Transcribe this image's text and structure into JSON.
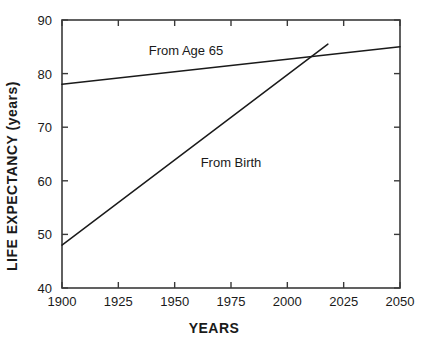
{
  "chart_data": {
    "type": "line",
    "title": "",
    "xlabel": "YEARS",
    "ylabel": "LIFE EXPECTANCY (years)",
    "xlim": [
      1900,
      2050
    ],
    "ylim": [
      40,
      90
    ],
    "xticks": [
      1900,
      1925,
      1950,
      1975,
      2000,
      2025,
      2050
    ],
    "yticks": [
      40,
      50,
      60,
      70,
      80,
      90
    ],
    "xtick_labels": [
      "1900",
      "1925",
      "1950",
      "1975",
      "2000",
      "2025",
      "2050"
    ],
    "ytick_labels": [
      "40",
      "50",
      "60",
      "70",
      "80",
      "90"
    ],
    "grid": false,
    "legend": "inline-annotations",
    "line_color": "#1a1a1a",
    "frame_color": "#3a3a3a",
    "series": [
      {
        "name": "From Age 65",
        "label": "From Age 65",
        "x": [
          1900,
          2050
        ],
        "values": [
          78,
          85
        ],
        "annotation_x": 1955,
        "annotation_y": 83.5
      },
      {
        "name": "From Birth",
        "label": "From Birth",
        "x": [
          1900,
          2018
        ],
        "values": [
          48,
          85.5
        ],
        "annotation_x": 1975,
        "annotation_y": 62.5
      }
    ],
    "annotations": [
      {
        "text": "From Age 65",
        "x": 1955,
        "y": 83.5
      },
      {
        "text": "From Birth",
        "x": 1975,
        "y": 62.5
      }
    ]
  }
}
